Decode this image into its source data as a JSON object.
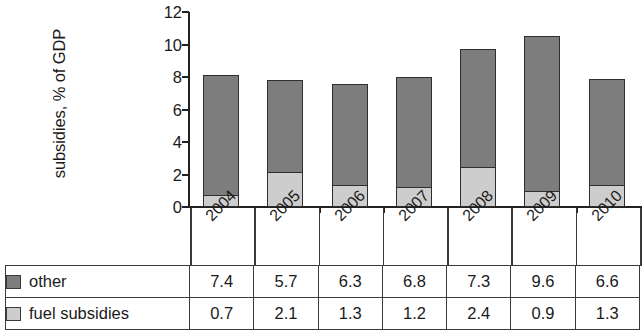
{
  "chart_data": {
    "type": "bar",
    "stacked": true,
    "title": "",
    "xlabel": "",
    "ylabel": "subsidies, % of GDP",
    "categories": [
      "2004",
      "2005",
      "2006",
      "2007",
      "2008",
      "2009",
      "2010"
    ],
    "ylim": [
      0,
      12
    ],
    "yticks": [
      0,
      2,
      4,
      6,
      8,
      10,
      12
    ],
    "ytick_labels": [
      "0",
      "2",
      "4",
      "6",
      "8",
      "10",
      "12"
    ],
    "grid": false,
    "legend_position": "table-below",
    "series": [
      {
        "name": "fuel subsidies",
        "color": "#cdcdcd",
        "values": [
          0.7,
          2.1,
          1.3,
          1.2,
          2.4,
          0.9,
          1.3
        ]
      },
      {
        "name": "other",
        "color": "#7d7d7d",
        "values": [
          7.4,
          5.7,
          6.3,
          6.8,
          7.3,
          9.6,
          6.6
        ]
      }
    ],
    "totals": [
      8.1,
      7.8,
      7.6,
      8.0,
      9.7,
      10.5,
      7.9
    ],
    "annotations": []
  },
  "axis": {
    "y_title": "subsidies, % of GDP",
    "y_tick_labels": [
      "12",
      "10",
      "8",
      "6",
      "4",
      "2",
      "0"
    ],
    "x_tick_labels": [
      "2004",
      "2005",
      "2006",
      "2007",
      "2008",
      "2009",
      "2010"
    ]
  },
  "table": {
    "rows": [
      {
        "label": "other",
        "swatch": "dark-gray-square-icon",
        "values": [
          "7.4",
          "5.7",
          "6.3",
          "6.8",
          "7.3",
          "9.6",
          "6.6"
        ]
      },
      {
        "label": "fuel subsidies",
        "swatch": "light-gray-square-icon",
        "values": [
          "0.7",
          "2.1",
          "1.3",
          "1.2",
          "2.4",
          "0.9",
          "1.3"
        ]
      }
    ]
  },
  "colors": {
    "other": "#7d7d7d",
    "fuel_subsidies": "#cdcdcd",
    "axis": "#222222",
    "rule": "#3a3a3a"
  }
}
